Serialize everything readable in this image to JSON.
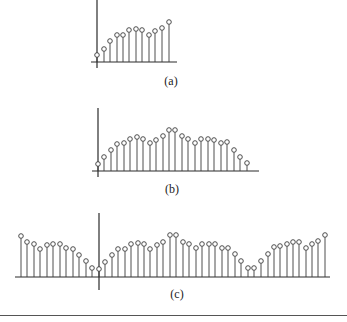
{
  "figure": {
    "bottom_rule_y": 315,
    "panels": [
      {
        "id": "a",
        "label": "(a)",
        "label_pos": [
          171,
          81
        ],
        "baseline_y": 62,
        "baseline_x": [
          91,
          177
        ],
        "axis_x": 97,
        "axis_y": [
          0,
          68
        ],
        "stems": [
          {
            "x": 97,
            "h": 7
          },
          {
            "x": 104,
            "h": 13
          },
          {
            "x": 110,
            "h": 21
          },
          {
            "x": 117,
            "h": 27
          },
          {
            "x": 123,
            "h": 27
          },
          {
            "x": 129,
            "h": 32
          },
          {
            "x": 136,
            "h": 33
          },
          {
            "x": 142,
            "h": 32
          },
          {
            "x": 149,
            "h": 27
          },
          {
            "x": 155,
            "h": 31
          },
          {
            "x": 162,
            "h": 34
          },
          {
            "x": 169,
            "h": 40
          }
        ]
      },
      {
        "id": "b",
        "label": "(b)",
        "label_pos": [
          172,
          189
        ],
        "baseline_y": 171,
        "baseline_x": [
          92,
          259
        ],
        "axis_x": 98,
        "axis_y": [
          108,
          177
        ],
        "stems": [
          {
            "x": 98,
            "h": 7
          },
          {
            "x": 104,
            "h": 14
          },
          {
            "x": 111,
            "h": 21
          },
          {
            "x": 117,
            "h": 27
          },
          {
            "x": 124,
            "h": 28
          },
          {
            "x": 130,
            "h": 32
          },
          {
            "x": 137,
            "h": 34
          },
          {
            "x": 143,
            "h": 32
          },
          {
            "x": 150,
            "h": 28
          },
          {
            "x": 156,
            "h": 31
          },
          {
            "x": 163,
            "h": 35
          },
          {
            "x": 169,
            "h": 41
          },
          {
            "x": 175,
            "h": 41
          },
          {
            "x": 182,
            "h": 35
          },
          {
            "x": 188,
            "h": 32
          },
          {
            "x": 195,
            "h": 28
          },
          {
            "x": 201,
            "h": 32
          },
          {
            "x": 208,
            "h": 32
          },
          {
            "x": 214,
            "h": 31
          },
          {
            "x": 221,
            "h": 28
          },
          {
            "x": 227,
            "h": 29
          },
          {
            "x": 234,
            "h": 21
          },
          {
            "x": 240,
            "h": 14
          },
          {
            "x": 247,
            "h": 8
          }
        ]
      },
      {
        "id": "c",
        "label": "(c)",
        "label_pos": [
          177,
          294
        ],
        "baseline_y": 277,
        "baseline_x": [
          15,
          330
        ],
        "axis_x": 99,
        "axis_y": [
          213,
          290
        ],
        "stems": [
          {
            "x": 21,
            "h": 41
          },
          {
            "x": 27,
            "h": 35
          },
          {
            "x": 34,
            "h": 33
          },
          {
            "x": 40,
            "h": 28
          },
          {
            "x": 47,
            "h": 32
          },
          {
            "x": 53,
            "h": 33
          },
          {
            "x": 60,
            "h": 33
          },
          {
            "x": 66,
            "h": 29
          },
          {
            "x": 73,
            "h": 28
          },
          {
            "x": 79,
            "h": 22
          },
          {
            "x": 86,
            "h": 16
          },
          {
            "x": 92,
            "h": 9
          },
          {
            "x": 99,
            "h": 8
          },
          {
            "x": 105,
            "h": 15
          },
          {
            "x": 112,
            "h": 22
          },
          {
            "x": 118,
            "h": 28
          },
          {
            "x": 125,
            "h": 28
          },
          {
            "x": 131,
            "h": 33
          },
          {
            "x": 138,
            "h": 34
          },
          {
            "x": 144,
            "h": 33
          },
          {
            "x": 150,
            "h": 28
          },
          {
            "x": 157,
            "h": 32
          },
          {
            "x": 163,
            "h": 35
          },
          {
            "x": 170,
            "h": 42
          },
          {
            "x": 176,
            "h": 42
          },
          {
            "x": 183,
            "h": 35
          },
          {
            "x": 189,
            "h": 33
          },
          {
            "x": 196,
            "h": 29
          },
          {
            "x": 202,
            "h": 33
          },
          {
            "x": 209,
            "h": 33
          },
          {
            "x": 215,
            "h": 33
          },
          {
            "x": 222,
            "h": 29
          },
          {
            "x": 228,
            "h": 29
          },
          {
            "x": 235,
            "h": 23
          },
          {
            "x": 241,
            "h": 16
          },
          {
            "x": 248,
            "h": 9
          },
          {
            "x": 254,
            "h": 9
          },
          {
            "x": 261,
            "h": 16
          },
          {
            "x": 268,
            "h": 23
          },
          {
            "x": 274,
            "h": 30
          },
          {
            "x": 280,
            "h": 31
          },
          {
            "x": 287,
            "h": 33
          },
          {
            "x": 293,
            "h": 35
          },
          {
            "x": 299,
            "h": 35
          },
          {
            "x": 306,
            "h": 29
          },
          {
            "x": 312,
            "h": 33
          },
          {
            "x": 318,
            "h": 36
          },
          {
            "x": 325,
            "h": 42
          }
        ]
      }
    ]
  }
}
